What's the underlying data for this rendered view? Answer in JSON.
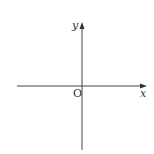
{
  "diagram": {
    "type": "coordinate-axes",
    "x_axis_label": "x",
    "y_axis_label": "y",
    "origin_label": "O",
    "colors": {
      "axis": "#444444",
      "background": "#ffffff"
    }
  }
}
